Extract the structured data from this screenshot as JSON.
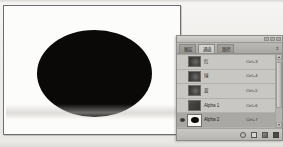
{
  "document": {
    "canvas_name": "image-canvas",
    "shape": "black-ellipse"
  },
  "panel": {
    "title": "",
    "window_buttons": [
      "minimize",
      "maximize",
      "close"
    ],
    "menu_icon": "≡",
    "tabs": [
      {
        "label": "图层",
        "active": false
      },
      {
        "label": "通道",
        "active": true
      },
      {
        "label": "路径",
        "active": false
      }
    ],
    "columns": {
      "visibility": "眼睛",
      "thumbnail": "缩览图",
      "name": "名称",
      "shortcut": "快捷键"
    },
    "channels": [
      {
        "name": "红",
        "shortcut": "Ctrl+3",
        "visible": false,
        "selected": false,
        "thumb": "rgb"
      },
      {
        "name": "绿",
        "shortcut": "Ctrl+4",
        "visible": false,
        "selected": false,
        "thumb": "rgb"
      },
      {
        "name": "蓝",
        "shortcut": "Ctrl+5",
        "visible": false,
        "selected": false,
        "thumb": "rgb"
      },
      {
        "name": "Alpha 1",
        "shortcut": "Ctrl+6",
        "visible": false,
        "selected": false,
        "thumb": "alpha"
      },
      {
        "name": "Alpha 2",
        "shortcut": "Ctrl+7",
        "visible": true,
        "selected": true,
        "thumb": "ellipse"
      }
    ],
    "scrollbar": {
      "up_arrow": "▲",
      "down_arrow": "▼"
    },
    "toolbar_buttons": [
      {
        "name": "load-channel-as-selection",
        "icon": "circle"
      },
      {
        "name": "save-selection-as-channel",
        "icon": "square"
      },
      {
        "name": "create-new-channel",
        "icon": "new-channel"
      },
      {
        "name": "delete-channel",
        "icon": "trash"
      }
    ]
  },
  "colors": {
    "panel_background": "#c2c1bd",
    "row_selected": "#a9a8a4",
    "shape_fill": "#0a0908",
    "canvas_background": "#fcfcfb"
  }
}
